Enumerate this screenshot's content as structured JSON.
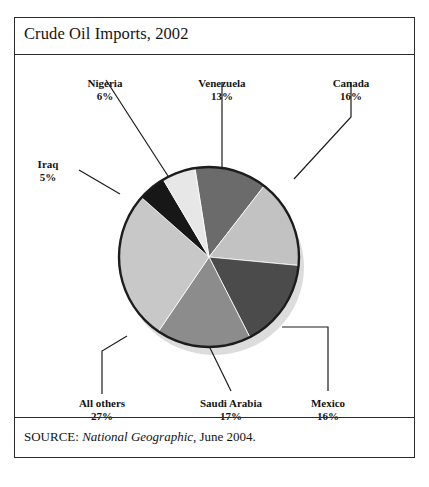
{
  "figure": {
    "title": "Crude Oil Imports, 2002",
    "source_prefix": "SOURCE:",
    "source_publication": "National Geographic",
    "source_suffix": ", June 2004."
  },
  "chart_data": {
    "type": "pie",
    "title": "Crude Oil Imports, 2002",
    "xlabel": "",
    "ylabel": "",
    "units": "percent",
    "total": 100,
    "legend": "none (direct labels with leader lines)",
    "grid": false,
    "categories": [
      "Venezuela",
      "Canada",
      "Mexico",
      "Saudi Arabia",
      "All others",
      "Iraq",
      "Nigeria"
    ],
    "values": [
      13,
      16,
      16,
      17,
      27,
      5,
      6
    ],
    "labels": [
      "13%",
      "16%",
      "16%",
      "17%",
      "27%",
      "5%",
      "6%"
    ],
    "slices": [
      {
        "name": "Venezuela",
        "value": 13,
        "label": "13%",
        "color": "#6b6b6b",
        "start_deg": 351,
        "end_deg": 397.8
      },
      {
        "name": "Canada",
        "value": 16,
        "label": "16%",
        "color": "#c2c2c2",
        "start_deg": 397.8,
        "end_deg": 455.4
      },
      {
        "name": "Mexico",
        "value": 16,
        "label": "16%",
        "color": "#4b4b4b",
        "start_deg": 455.4,
        "end_deg": 513.0
      },
      {
        "name": "Saudi Arabia",
        "value": 17,
        "label": "17%",
        "color": "#8c8c8c",
        "start_deg": 513.0,
        "end_deg": 574.2
      },
      {
        "name": "All others",
        "value": 27,
        "label": "27%",
        "color": "#c8c8c8",
        "start_deg": 574.2,
        "end_deg": 671.4
      },
      {
        "name": "Iraq",
        "value": 5,
        "label": "5%",
        "color": "#171717",
        "start_deg": 671.4,
        "end_deg": 689.4
      },
      {
        "name": "Nigeria",
        "value": 6,
        "label": "6%",
        "color": "#e7e7e7",
        "start_deg": 689.4,
        "end_deg": 711.0
      }
    ]
  }
}
